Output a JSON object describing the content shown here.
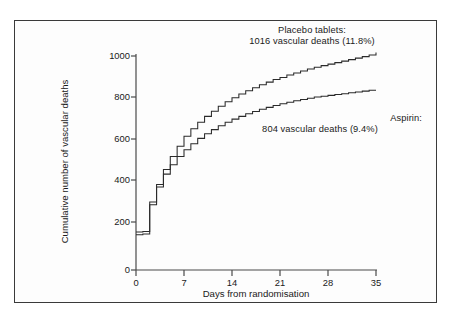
{
  "chart_data": {
    "type": "line",
    "title": "",
    "xlabel": "Days from randomisation",
    "ylabel": "Cumulative number of vascular deaths",
    "xlim": [
      0,
      35
    ],
    "ylim": [
      0,
      1000
    ],
    "xticks": [
      "0",
      "7",
      "14",
      "21",
      "28",
      "35"
    ],
    "yticks": [
      "0",
      "200",
      "400",
      "600",
      "800",
      "1000"
    ],
    "grid": false,
    "legend_position": "annotations-inline",
    "step_style": "post",
    "annotations": [
      {
        "name": "placebo",
        "line1": "Placebo tablets:",
        "line2": "1016 vascular deaths (11.8%)"
      },
      {
        "name": "aspirin",
        "line1": "Aspirin:",
        "line2": "804 vascular deaths (9.4%)"
      }
    ],
    "series": [
      {
        "name": "Placebo tablets",
        "label": "Placebo tablets: 1016 vascular deaths (11.8%)",
        "total_deaths": 1016,
        "percent": 11.8,
        "color": "#2a2a2a",
        "x": [
          0,
          1,
          2,
          3,
          4,
          5,
          6,
          7,
          8,
          9,
          10,
          11,
          12,
          13,
          14,
          15,
          16,
          17,
          18,
          19,
          20,
          21,
          22,
          23,
          24,
          25,
          26,
          27,
          28,
          29,
          30,
          31,
          32,
          33,
          34,
          35
        ],
        "values": [
          178,
          180,
          318,
          400,
          470,
          530,
          578,
          625,
          660,
          690,
          718,
          742,
          765,
          786,
          805,
          822,
          838,
          852,
          866,
          878,
          890,
          900,
          911,
          921,
          930,
          939,
          947,
          955,
          962,
          969,
          976,
          983,
          990,
          997,
          1005,
          1016
        ]
      },
      {
        "name": "Aspirin",
        "label": "Aspirin: 804 vascular deaths (9.4%)",
        "total_deaths": 804,
        "percent": 9.4,
        "color": "#2a2a2a",
        "x": [
          0,
          1,
          2,
          3,
          4,
          5,
          6,
          7,
          8,
          9,
          10,
          11,
          12,
          13,
          14,
          15,
          16,
          17,
          18,
          19,
          20,
          21,
          22,
          23,
          24,
          25,
          26,
          27,
          28,
          29,
          30,
          31,
          32,
          33,
          34,
          35
        ],
        "values": [
          165,
          168,
          305,
          388,
          448,
          492,
          530,
          562,
          590,
          615,
          637,
          656,
          674,
          690,
          705,
          718,
          730,
          741,
          751,
          760,
          769,
          777,
          784,
          791,
          797,
          803,
          808,
          812,
          816,
          820,
          824,
          828,
          832,
          836,
          840,
          804
        ]
      }
    ]
  },
  "axes": {
    "ylabel": "Cumulative number of vascular deaths",
    "xlabel": "Days from randomisation",
    "ytick_labels": [
      "1000",
      "800",
      "600",
      "400",
      "200",
      "0"
    ],
    "xtick_labels": [
      "0",
      "7",
      "14",
      "21",
      "28",
      "35"
    ]
  }
}
